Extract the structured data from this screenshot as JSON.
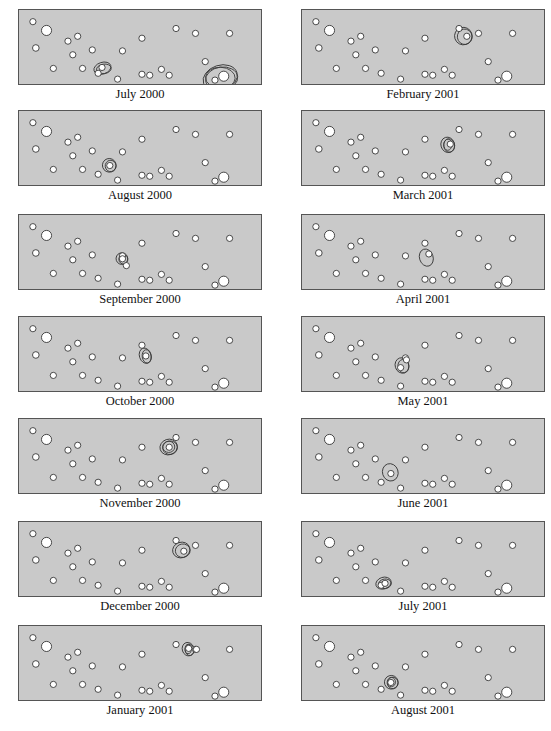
{
  "figure": {
    "colors": {
      "panel_bg": "#c9c9c9",
      "border": "#555555",
      "dot_fill": "#ffffff",
      "dot_stroke": "#333333",
      "contour": "#3a3a3a"
    },
    "base_dots": [
      {
        "x": 12,
        "y": 12,
        "r": 3.2
      },
      {
        "x": 26,
        "y": 21,
        "r": 5.2
      },
      {
        "x": 15,
        "y": 39,
        "r": 3.4
      },
      {
        "x": 48,
        "y": 32,
        "r": 3.2
      },
      {
        "x": 58,
        "y": 27,
        "r": 3.2
      },
      {
        "x": 53,
        "y": 46,
        "r": 3.2
      },
      {
        "x": 73,
        "y": 41,
        "r": 3.2
      },
      {
        "x": 33,
        "y": 60,
        "r": 3.2
      },
      {
        "x": 63,
        "y": 60,
        "r": 3.2
      },
      {
        "x": 79,
        "y": 65,
        "r": 3.2
      },
      {
        "x": 104,
        "y": 42,
        "r": 3.2
      },
      {
        "x": 124,
        "y": 29,
        "r": 3.2
      },
      {
        "x": 99,
        "y": 71,
        "r": 3.2
      },
      {
        "x": 124,
        "y": 66,
        "r": 3.2
      },
      {
        "x": 132,
        "y": 67,
        "r": 3.2
      },
      {
        "x": 144,
        "y": 61,
        "r": 3.2
      },
      {
        "x": 152,
        "y": 67,
        "r": 3.2
      },
      {
        "x": 159,
        "y": 19,
        "r": 3.2
      },
      {
        "x": 179,
        "y": 24,
        "r": 3.2
      },
      {
        "x": 214,
        "y": 24,
        "r": 3.2
      },
      {
        "x": 189,
        "y": 53,
        "r": 3.2
      },
      {
        "x": 199,
        "y": 72,
        "r": 3.2
      },
      {
        "x": 208,
        "y": 68,
        "r": 5.2
      }
    ],
    "panels": [
      {
        "label": "July 2000",
        "col": 0,
        "row": 0,
        "extra_dots": [
          {
            "x": 83,
            "y": 59,
            "r": 3.2
          }
        ],
        "contours": [
          {
            "cx": 84,
            "cy": 60,
            "rx": 9,
            "ry": 6,
            "rings": 2
          },
          {
            "cx": 205,
            "cy": 70,
            "rx": 18,
            "ry": 13,
            "rings": 3
          }
        ]
      },
      {
        "label": "August 2000",
        "col": 0,
        "row": 1,
        "extra_dots": [
          {
            "x": 91,
            "y": 56,
            "r": 3.2
          }
        ],
        "contours": [
          {
            "cx": 91,
            "cy": 56,
            "rx": 7,
            "ry": 7,
            "rings": 2
          }
        ]
      },
      {
        "label": "September 2000",
        "col": 0,
        "row": 2,
        "extra_dots": [
          {
            "x": 104,
            "y": 45,
            "r": 3.2
          },
          {
            "x": 108,
            "y": 52,
            "r": 3.2
          }
        ],
        "contours": [
          {
            "cx": 104,
            "cy": 45,
            "rx": 6,
            "ry": 6,
            "rings": 2
          }
        ]
      },
      {
        "label": "October 2000",
        "col": 0,
        "row": 3,
        "extra_dots": [
          {
            "x": 128,
            "y": 40,
            "r": 3.2
          }
        ],
        "contours": [
          {
            "cx": 128,
            "cy": 40,
            "rx": 6,
            "ry": 8,
            "rings": 2
          }
        ]
      },
      {
        "label": "November 2000",
        "col": 0,
        "row": 4,
        "extra_dots": [
          {
            "x": 152,
            "y": 29,
            "r": 3.2
          }
        ],
        "contours": [
          {
            "cx": 152,
            "cy": 29,
            "rx": 9,
            "ry": 8,
            "rings": 3
          }
        ]
      },
      {
        "label": "December 2000",
        "col": 0,
        "row": 5,
        "extra_dots": [
          {
            "x": 167,
            "y": 30,
            "r": 3.2
          }
        ],
        "contours": [
          {
            "cx": 165,
            "cy": 29,
            "rx": 9,
            "ry": 8,
            "rings": 2
          }
        ]
      },
      {
        "label": "January 2001",
        "col": 0,
        "row": 6,
        "extra_dots": [
          {
            "x": 172,
            "y": 23,
            "r": 3.2
          },
          {
            "x": 180,
            "y": 24,
            "r": 3.2
          }
        ],
        "contours": [
          {
            "cx": 172,
            "cy": 24,
            "rx": 6,
            "ry": 7,
            "rings": 3
          }
        ]
      },
      {
        "label": "February 2001",
        "col": 1,
        "row": 0,
        "extra_dots": [
          {
            "x": 167,
            "y": 27,
            "r": 3.2
          }
        ],
        "contours": [
          {
            "cx": 164,
            "cy": 27,
            "rx": 9,
            "ry": 9,
            "rings": 2
          }
        ]
      },
      {
        "label": "March 2001",
        "col": 1,
        "row": 1,
        "extra_dots": [
          {
            "x": 150,
            "y": 34,
            "r": 3.2
          }
        ],
        "contours": [
          {
            "cx": 148,
            "cy": 35,
            "rx": 7,
            "ry": 8,
            "rings": 3
          }
        ]
      },
      {
        "label": "April 2001",
        "col": 1,
        "row": 2,
        "extra_dots": [
          {
            "x": 128,
            "y": 40,
            "r": 3.2
          }
        ],
        "contours": [
          {
            "cx": 126,
            "cy": 44,
            "rx": 7,
            "ry": 9,
            "rings": 1
          }
        ]
      },
      {
        "label": "May 2001",
        "col": 1,
        "row": 3,
        "extra_dots": [
          {
            "x": 105,
            "y": 44,
            "r": 3.2
          },
          {
            "x": 99,
            "y": 52,
            "r": 3.2
          }
        ],
        "contours": [
          {
            "cx": 101,
            "cy": 50,
            "rx": 7,
            "ry": 8,
            "rings": 2
          }
        ]
      },
      {
        "label": "June 2001",
        "col": 1,
        "row": 4,
        "extra_dots": [
          {
            "x": 89,
            "y": 56,
            "r": 3.2
          }
        ],
        "contours": [
          {
            "cx": 89,
            "cy": 55,
            "rx": 8,
            "ry": 9,
            "rings": 1
          }
        ]
      },
      {
        "label": "July 2001",
        "col": 1,
        "row": 5,
        "extra_dots": [
          {
            "x": 83,
            "y": 63,
            "r": 3.2
          }
        ],
        "contours": [
          {
            "cx": 82,
            "cy": 63,
            "rx": 8,
            "ry": 6,
            "rings": 2
          }
        ]
      },
      {
        "label": "August 2001",
        "col": 1,
        "row": 6,
        "extra_dots": [
          {
            "x": 89,
            "y": 58,
            "r": 3.2
          }
        ],
        "contours": [
          {
            "cx": 90,
            "cy": 58,
            "rx": 7,
            "ry": 7,
            "rings": 3
          }
        ]
      }
    ],
    "layout": {
      "col_x": [
        18,
        301
      ],
      "row_y": [
        9,
        110,
        214,
        316,
        418,
        521,
        625
      ]
    }
  }
}
